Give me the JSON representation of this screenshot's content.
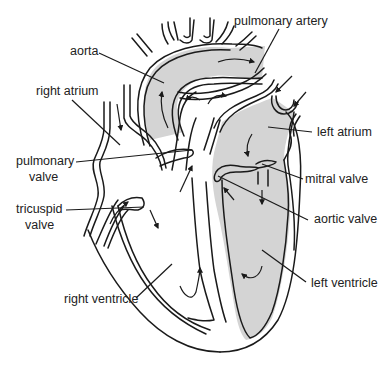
{
  "figure": {
    "shading_color": "#d4d4d4",
    "line_color": "#1a1a1a",
    "background_color": "#ffffff"
  },
  "labels": {
    "aorta": {
      "text": "aorta"
    },
    "pulmonary_artery": {
      "text": "pulmonary artery"
    },
    "right_atrium": {
      "text": "right atrium"
    },
    "left_atrium": {
      "text": "left atrium"
    },
    "pulmonary_valve": {
      "line1": "pulmonary",
      "line2": "valve"
    },
    "mitral_valve": {
      "text": "mitral valve"
    },
    "tricuspid_valve": {
      "line1": "tricuspid",
      "line2": "valve"
    },
    "aortic_valve": {
      "text": "aortic valve"
    },
    "right_ventricle": {
      "text": "right ventricle"
    },
    "left_ventricle": {
      "text": "left ventricle"
    }
  },
  "legend": {
    "shaded_regions": "oxygenated blood (left side of heart, aorta)",
    "unshaded_regions": "deoxygenated blood (right side of heart, pulmonary artery)"
  }
}
